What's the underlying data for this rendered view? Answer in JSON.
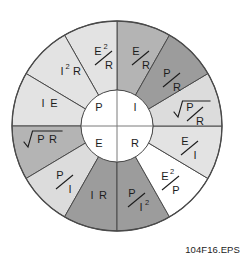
{
  "figure": {
    "caption": "104F16.EPS",
    "geometry": {
      "center_x": 117,
      "center_y": 126,
      "outer_radius": 105,
      "inner_radius": 36,
      "wedge_count": 12,
      "wedge_degrees": 30
    },
    "colors": {
      "outline": "#4a4a4a",
      "hub_fill": "#ffffff",
      "text": "#1c1c1c",
      "shade_lightest": "#e3e3e3",
      "shade_light": "#dcdcdc",
      "shade_medium": "#b4b4b4",
      "shade_dark": "#9c9c9c",
      "shade_white": "#ffffff"
    }
  },
  "hub": {
    "quadrants": [
      {
        "id": "hub-p",
        "label": "P",
        "position": "top-left"
      },
      {
        "id": "hub-i",
        "label": "I",
        "position": "top-right"
      },
      {
        "id": "hub-e",
        "label": "E",
        "position": "bottom-left"
      },
      {
        "id": "hub-r",
        "label": "R",
        "position": "bottom-right"
      }
    ]
  },
  "wedges": [
    {
      "id": "wedge-e2-over-r",
      "quadrant": "top-left",
      "index": 0,
      "start_deg": -90,
      "end_deg": -60,
      "fill": "#b4b4b4",
      "form": "fraction-slash",
      "numerator": "E",
      "numerator_sup": "2",
      "denominator": "R",
      "plain": "E2/R"
    },
    {
      "id": "wedge-i2-r",
      "quadrant": "top-left",
      "index": 1,
      "start_deg": -120,
      "end_deg": -90,
      "fill": "#e3e3e3",
      "form": "inline",
      "numerator": "I",
      "numerator_sup": "2",
      "denominator": "R",
      "plain": "I2 R"
    },
    {
      "id": "wedge-i-e",
      "quadrant": "top-left",
      "index": 2,
      "start_deg": -150,
      "end_deg": -120,
      "fill": "#e3e3e3",
      "form": "inline",
      "numerator": "I",
      "numerator_sup": "",
      "denominator": "E",
      "plain": "I E"
    },
    {
      "id": "wedge-e-over-r",
      "quadrant": "top-right",
      "index": 3,
      "start_deg": -90,
      "end_deg": -60,
      "fill": "#9c9c9c",
      "form": "fraction-slash",
      "numerator": "E",
      "numerator_sup": "",
      "denominator": "R",
      "plain": "E/R"
    },
    {
      "id": "wedge-p-over-e",
      "quadrant": "top-right",
      "index": 4,
      "start_deg": -60,
      "end_deg": -30,
      "fill": "#dcdcdc",
      "form": "fraction-slash",
      "numerator": "P",
      "numerator_sup": "",
      "denominator": "E",
      "plain": "P/E"
    },
    {
      "id": "wedge-sqrt-p-over-r",
      "quadrant": "top-right",
      "index": 5,
      "start_deg": -30,
      "end_deg": 0,
      "fill": "#e3e3e3",
      "form": "radical-fraction",
      "numerator": "P",
      "numerator_sup": "",
      "denominator": "R",
      "plain": "sqrt(P/R)"
    },
    {
      "id": "wedge-e-over-i",
      "quadrant": "bottom-right",
      "index": 6,
      "start_deg": 0,
      "end_deg": 30,
      "fill": "#ffffff",
      "form": "fraction-slash",
      "numerator": "E",
      "numerator_sup": "",
      "denominator": "I",
      "plain": "E/I"
    },
    {
      "id": "wedge-e2-over-p",
      "quadrant": "bottom-right",
      "index": 7,
      "start_deg": 30,
      "end_deg": 60,
      "fill": "#9c9c9c",
      "form": "fraction-slash",
      "numerator": "E",
      "numerator_sup": "2",
      "denominator": "P",
      "plain": "E2/P"
    },
    {
      "id": "wedge-p-over-i2",
      "quadrant": "bottom-right",
      "index": 8,
      "start_deg": 60,
      "end_deg": 90,
      "fill": "#9c9c9c",
      "form": "fraction-slash",
      "numerator": "P",
      "numerator_sup": "",
      "denominator": "I",
      "denominator_sup": "2",
      "plain": "P/I2"
    },
    {
      "id": "wedge-i-r",
      "quadrant": "bottom-left",
      "index": 9,
      "start_deg": 90,
      "end_deg": 120,
      "fill": "#dcdcdc",
      "form": "inline",
      "numerator": "I",
      "numerator_sup": "",
      "denominator": "R",
      "plain": "I R"
    },
    {
      "id": "wedge-p-over-i",
      "quadrant": "bottom-left",
      "index": 10,
      "start_deg": 120,
      "end_deg": 150,
      "fill": "#b4b4b4",
      "form": "fraction-slash",
      "numerator": "P",
      "numerator_sup": "",
      "denominator": "I",
      "plain": "P/I"
    },
    {
      "id": "wedge-sqrt-pr",
      "quadrant": "bottom-left",
      "index": 11,
      "start_deg": 150,
      "end_deg": 180,
      "fill": "#e3e3e3",
      "form": "radical-inline",
      "numerator": "P",
      "numerator_sup": "",
      "denominator": "R",
      "plain": "sqrt(P R)"
    }
  ]
}
